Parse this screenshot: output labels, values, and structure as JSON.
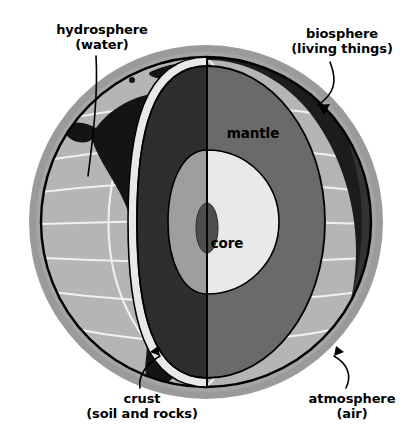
{
  "figure": {
    "background_color": "#ffffff"
  },
  "labels": {
    "hydrosphere": {
      "name": "hydrosphere",
      "detail": "(water)"
    },
    "biosphere": {
      "name": "biosphere",
      "detail": "(living things)"
    },
    "crust": {
      "name": "crust",
      "detail": "(soil and rocks)"
    },
    "atmosphere": {
      "name": "atmosphere",
      "detail": "(air)"
    },
    "mantle": {
      "name": "mantle"
    },
    "core": {
      "name": "core"
    }
  },
  "colors": {
    "atmosphere_ring": "#9a9a9a",
    "ocean": "#b5b5b5",
    "land": "#1a1a1a",
    "graticule": "#f2f2f2",
    "crust_band": "#e3e3e3",
    "mantle": "#6a6a6a",
    "cut_face": "#2e2e2e",
    "outer_core": "#e8e8e8",
    "inner_core": "#4a4a4a",
    "outline": "#000000",
    "text": "#000000"
  },
  "geometry": {
    "globe_center_x": 206,
    "globe_center_y": 222,
    "globe_radius": 165,
    "atmosphere_radius": 178,
    "cut_axis_x": 207,
    "mantle_outer_rx": 118,
    "core_rx": 72,
    "inner_core_rx": 11
  },
  "layers": [
    {
      "id": "atmosphere",
      "label": "atmosphere (air)"
    },
    {
      "id": "biosphere",
      "label": "biosphere (living things)"
    },
    {
      "id": "hydrosphere",
      "label": "hydrosphere (water)"
    },
    {
      "id": "crust",
      "label": "crust (soil and rocks)"
    },
    {
      "id": "mantle",
      "label": "mantle"
    },
    {
      "id": "core",
      "label": "core"
    }
  ]
}
